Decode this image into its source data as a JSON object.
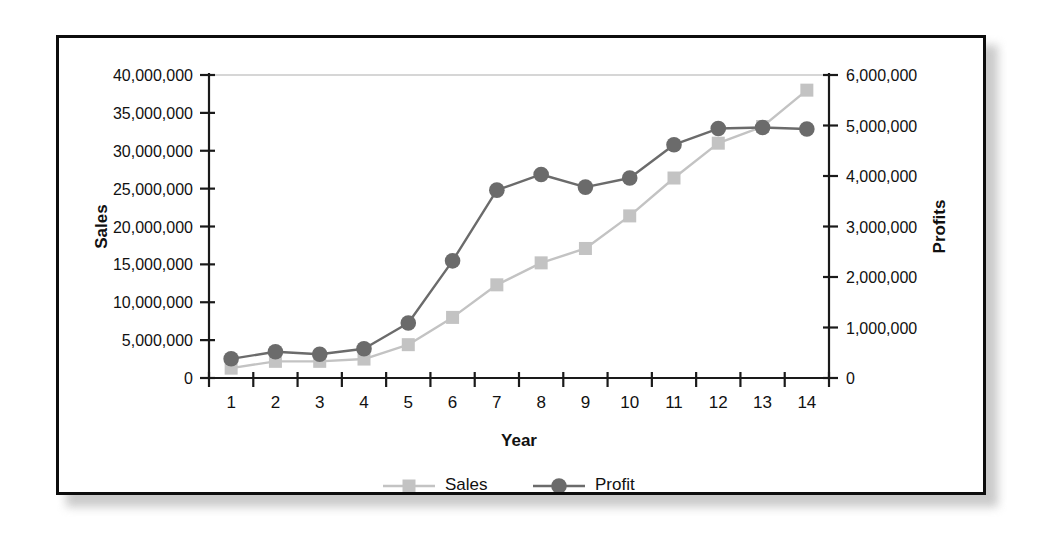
{
  "chart_data": {
    "type": "line",
    "title": "",
    "xlabel": "Year",
    "ylabel": "Sales",
    "y2label": "Profits",
    "grid": false,
    "legend_position": "bottom",
    "categories": [
      "1",
      "2",
      "3",
      "4",
      "5",
      "6",
      "7",
      "8",
      "9",
      "10",
      "11",
      "12",
      "13",
      "14"
    ],
    "x": [
      1,
      2,
      3,
      4,
      5,
      6,
      7,
      8,
      9,
      10,
      11,
      12,
      13,
      14
    ],
    "ylim": [
      0,
      40000000
    ],
    "y2lim": [
      0,
      6000000
    ],
    "yticks": [
      0,
      5000000,
      10000000,
      15000000,
      20000000,
      25000000,
      30000000,
      35000000,
      40000000
    ],
    "ytick_labels": [
      "0",
      "5,000,000",
      "10,000,000",
      "15,000,000",
      "20,000,000",
      "25,000,000",
      "30,000,000",
      "35,000,000",
      "40,000,000"
    ],
    "y2ticks": [
      0,
      1000000,
      2000000,
      3000000,
      4000000,
      5000000,
      6000000
    ],
    "y2tick_labels": [
      "0",
      "1,000,000",
      "2,000,000",
      "3,000,000",
      "4,000,000",
      "5,000,000",
      "6,000,000"
    ],
    "series": [
      {
        "name": "Sales",
        "axis": "left",
        "marker": "square",
        "color": "#c3c3c3",
        "values": [
          1300000,
          2200000,
          2200000,
          2500000,
          4400000,
          8000000,
          12300000,
          15200000,
          17100000,
          21400000,
          26400000,
          31000000,
          33200000,
          38000000
        ]
      },
      {
        "name": "Profit",
        "axis": "right",
        "marker": "circle",
        "color": "#6b6b6b",
        "values": [
          380000,
          520000,
          470000,
          580000,
          1090000,
          2320000,
          3720000,
          4030000,
          3780000,
          3960000,
          4620000,
          4940000,
          4960000,
          4930000
        ]
      }
    ],
    "legend": [
      {
        "label": "Sales",
        "marker": "square",
        "color": "#c3c3c3"
      },
      {
        "label": "Profit",
        "marker": "circle",
        "color": "#6b6b6b"
      }
    ]
  },
  "colors": {
    "sales": "#c3c3c3",
    "profit": "#6b6b6b",
    "axis": "#1a1a1a",
    "frame": "#0d0d0d",
    "text": "#111111",
    "background": "#ffffff"
  }
}
